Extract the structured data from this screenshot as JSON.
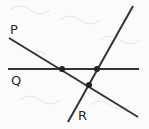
{
  "diagram": {
    "title": "",
    "lines": [
      {
        "name": "P",
        "label": "P"
      },
      {
        "name": "Q",
        "label": "Q"
      },
      {
        "name": "R",
        "label": "R"
      }
    ],
    "intersections": [
      {
        "lines": [
          "P",
          "Q"
        ]
      },
      {
        "lines": [
          "Q",
          "R"
        ]
      },
      {
        "lines": [
          "P",
          "R"
        ]
      }
    ],
    "colors": {
      "line": "#333333",
      "point": "#222222",
      "background": "#fbfbfb"
    }
  }
}
